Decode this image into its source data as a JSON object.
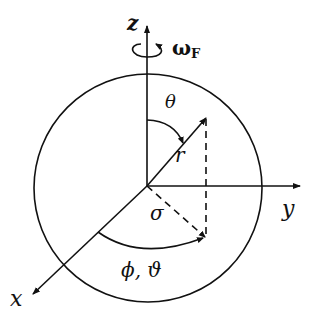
{
  "diagram": {
    "axes": {
      "z": "z",
      "y": "y",
      "x": "x"
    },
    "rotation": {
      "symbol": "ω",
      "subscript": "F"
    },
    "labels": {
      "theta": "θ",
      "radius": "r",
      "sigma": "σ",
      "phi": "ϕ, ϑ"
    },
    "colors": {
      "stroke": "#111111",
      "background": "#ffffff"
    }
  }
}
